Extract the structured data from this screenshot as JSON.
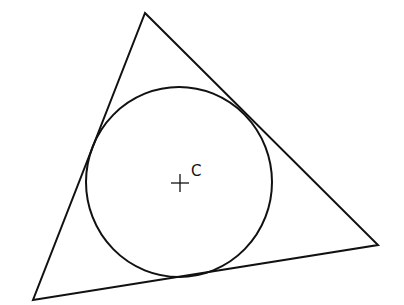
{
  "diagram": {
    "type": "triangle-with-incircle",
    "stroke_color": "#111111",
    "background": "#ffffff",
    "triangle": {
      "vertices": [
        {
          "x": 145,
          "y": 13
        },
        {
          "x": 378,
          "y": 245
        },
        {
          "x": 33,
          "y": 300
        }
      ]
    },
    "incircle": {
      "cx": 179,
      "cy": 182,
      "rx": 93,
      "ry": 95
    },
    "center_marker": {
      "x": 180,
      "y": 183,
      "size": 9
    },
    "center_label": {
      "text": "C",
      "x": 191,
      "y": 176
    }
  }
}
